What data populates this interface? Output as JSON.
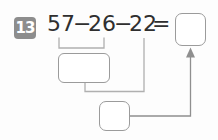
{
  "problem": {
    "number": "13",
    "tokens": {
      "operand1": "57",
      "minus1": "−",
      "operand2": "26",
      "minus2": "−",
      "operand3": "22",
      "equals": "="
    },
    "answer": "",
    "step1_value": "",
    "step2_value": ""
  },
  "colors": {
    "badge_background": "#8d8d8d",
    "badge_text": "#ffffff",
    "expression_text": "#2f2f2f",
    "box_border": "#9b9b9b",
    "connector_line": "#b0b0b0",
    "arrow": "#8f8f8f",
    "background": "#fdfdfd"
  }
}
